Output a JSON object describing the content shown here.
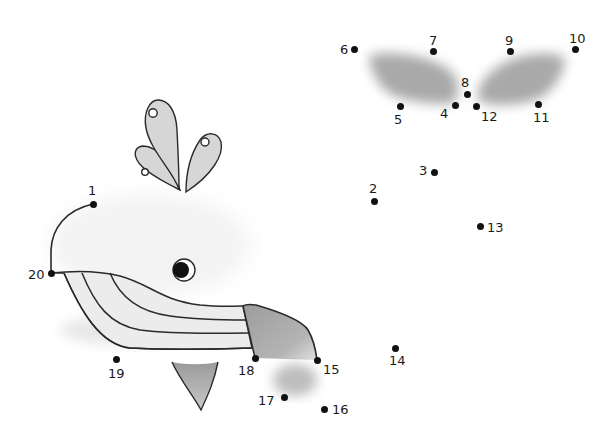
{
  "puzzle": {
    "type": "connect-the-dots",
    "subject": "whale",
    "colors": {
      "outline": "#2a2a2a",
      "fill_light": "#d9d9d9",
      "fill_mid": "#b0b0b0",
      "shadow": "#a8a8a8",
      "dot": "#111111"
    },
    "dots": [
      {
        "n": "1",
        "x": 93,
        "y": 204,
        "lx": 88,
        "ly": 184
      },
      {
        "n": "2",
        "x": 374,
        "y": 201,
        "lx": 369,
        "ly": 182
      },
      {
        "n": "3",
        "x": 434,
        "y": 172,
        "lx": 419,
        "ly": 164
      },
      {
        "n": "4",
        "x": 455,
        "y": 105,
        "lx": 440,
        "ly": 107
      },
      {
        "n": "5",
        "x": 400,
        "y": 106,
        "lx": 394,
        "ly": 113
      },
      {
        "n": "6",
        "x": 354,
        "y": 49,
        "lx": 340,
        "ly": 43
      },
      {
        "n": "7",
        "x": 433,
        "y": 51,
        "lx": 429,
        "ly": 34
      },
      {
        "n": "8",
        "x": 467,
        "y": 94,
        "lx": 461,
        "ly": 76
      },
      {
        "n": "9",
        "x": 510,
        "y": 51,
        "lx": 505,
        "ly": 34
      },
      {
        "n": "10",
        "x": 575,
        "y": 49,
        "lx": 569,
        "ly": 32
      },
      {
        "n": "11",
        "x": 538,
        "y": 104,
        "lx": 533,
        "ly": 111
      },
      {
        "n": "12",
        "x": 476,
        "y": 106,
        "lx": 481,
        "ly": 110
      },
      {
        "n": "13",
        "x": 480,
        "y": 226,
        "lx": 487,
        "ly": 221
      },
      {
        "n": "14",
        "x": 395,
        "y": 348,
        "lx": 389,
        "ly": 354
      },
      {
        "n": "15",
        "x": 317,
        "y": 360,
        "lx": 323,
        "ly": 363
      },
      {
        "n": "16",
        "x": 324,
        "y": 409,
        "lx": 332,
        "ly": 403
      },
      {
        "n": "17",
        "x": 284,
        "y": 397,
        "lx": 258,
        "ly": 394
      },
      {
        "n": "18",
        "x": 255,
        "y": 358,
        "lx": 238,
        "ly": 364
      },
      {
        "n": "19",
        "x": 116,
        "y": 359,
        "lx": 108,
        "ly": 367
      },
      {
        "n": "20",
        "x": 51,
        "y": 273,
        "lx": 28,
        "ly": 268
      }
    ],
    "drawn_parts": [
      "head-arc",
      "water-spout",
      "eye",
      "striped-belly",
      "flipper",
      "tail-fin-shadow",
      "tail-flukes-shadow"
    ]
  }
}
